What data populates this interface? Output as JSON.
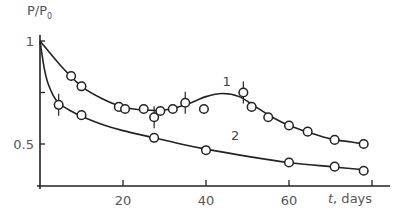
{
  "chart_data": {
    "type": "line",
    "title": "",
    "xlabel": "t, days",
    "ylabel": "P/P0",
    "xlim": [
      0,
      85
    ],
    "ylim": [
      0.3,
      1.0
    ],
    "x_ticks": [
      20,
      40,
      60,
      80
    ],
    "x_tick_labels": [
      "20",
      "40",
      "60",
      ""
    ],
    "y_ticks": [
      0.5,
      0.75,
      1.0
    ],
    "y_tick_labels": [
      "0.5",
      "",
      "1"
    ],
    "grid": false,
    "legend": "inline curve labels",
    "series": [
      {
        "name": "1",
        "markers": "open circles",
        "points": [
          {
            "x": 7.5,
            "y": 0.83
          },
          {
            "x": 10,
            "y": 0.78
          },
          {
            "x": 19,
            "y": 0.68
          },
          {
            "x": 20.5,
            "y": 0.67
          },
          {
            "x": 25,
            "y": 0.67
          },
          {
            "x": 27.5,
            "y": 0.63,
            "error_bar": true
          },
          {
            "x": 29,
            "y": 0.66
          },
          {
            "x": 32,
            "y": 0.67
          },
          {
            "x": 35,
            "y": 0.7,
            "error_bar": true
          },
          {
            "x": 39.5,
            "y": 0.67
          },
          {
            "x": 49,
            "y": 0.75,
            "error_bar": true
          },
          {
            "x": 51,
            "y": 0.68
          },
          {
            "x": 55,
            "y": 0.63
          },
          {
            "x": 60,
            "y": 0.59
          },
          {
            "x": 64.5,
            "y": 0.56
          },
          {
            "x": 71,
            "y": 0.52
          },
          {
            "x": 78,
            "y": 0.5
          }
        ],
        "fit_curve": [
          [
            0,
            1.0
          ],
          [
            5,
            0.88
          ],
          [
            10,
            0.78
          ],
          [
            15,
            0.72
          ],
          [
            20,
            0.68
          ],
          [
            25,
            0.665
          ],
          [
            30,
            0.665
          ],
          [
            35,
            0.69
          ],
          [
            40,
            0.73
          ],
          [
            44,
            0.745
          ],
          [
            48,
            0.73
          ],
          [
            52,
            0.68
          ],
          [
            56,
            0.63
          ],
          [
            60,
            0.59
          ],
          [
            65,
            0.555
          ],
          [
            70,
            0.525
          ],
          [
            75,
            0.51
          ],
          [
            78,
            0.5
          ]
        ],
        "label_position": {
          "x": 45,
          "y": 0.78
        }
      },
      {
        "name": "2",
        "markers": "open circles",
        "points": [
          {
            "x": 4.5,
            "y": 0.69,
            "error_bar": true
          },
          {
            "x": 10,
            "y": 0.64
          },
          {
            "x": 27.5,
            "y": 0.53
          },
          {
            "x": 40,
            "y": 0.47
          },
          {
            "x": 60,
            "y": 0.41
          },
          {
            "x": 71,
            "y": 0.39
          },
          {
            "x": 78,
            "y": 0.37
          }
        ],
        "fit_curve": [
          [
            0,
            1.0
          ],
          [
            1,
            0.87
          ],
          [
            2,
            0.79
          ],
          [
            4,
            0.71
          ],
          [
            7,
            0.665
          ],
          [
            10,
            0.635
          ],
          [
            15,
            0.595
          ],
          [
            20,
            0.565
          ],
          [
            27.5,
            0.53
          ],
          [
            35,
            0.495
          ],
          [
            40,
            0.475
          ],
          [
            50,
            0.44
          ],
          [
            60,
            0.41
          ],
          [
            70,
            0.39
          ],
          [
            78,
            0.375
          ]
        ],
        "label_position": {
          "x": 47,
          "y": 0.52
        }
      }
    ]
  },
  "labels": {
    "ylabel_main": "P/P",
    "ylabel_sub": "0",
    "xlabel_var": "t",
    "xlabel_rest": ", days"
  }
}
